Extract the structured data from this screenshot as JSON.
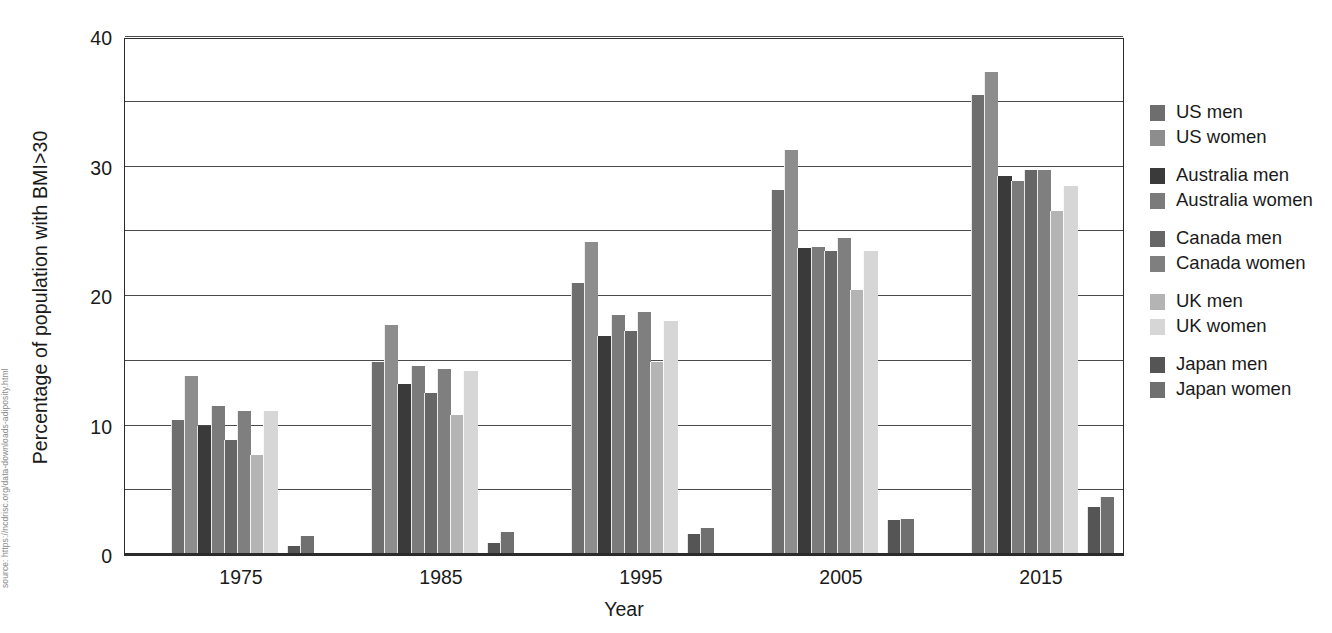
{
  "source_note": "source: https://ncdrisc.org/data-downloads-adiposity.html",
  "legend": {
    "groups": [
      {
        "items": [
          {
            "label": "US men",
            "color": "#6e6e6e"
          },
          {
            "label": "US women",
            "color": "#8d8d8d"
          }
        ]
      },
      {
        "items": [
          {
            "label": "Australia men",
            "color": "#3a3a3a"
          },
          {
            "label": "Australia women",
            "color": "#7b7b7b"
          }
        ]
      },
      {
        "items": [
          {
            "label": "Canada men",
            "color": "#666666"
          },
          {
            "label": "Canada women",
            "color": "#7f7f7f"
          }
        ]
      },
      {
        "items": [
          {
            "label": "UK men",
            "color": "#b4b4b4"
          },
          {
            "label": "UK women",
            "color": "#d6d6d6"
          }
        ]
      },
      {
        "items": [
          {
            "label": "Japan men",
            "color": "#555555"
          },
          {
            "label": "Japan women",
            "color": "#707070"
          }
        ]
      }
    ]
  },
  "chart_data": {
    "type": "bar",
    "title": "",
    "xlabel": "Year",
    "ylabel": "Percentage of population with BMI>30",
    "categories": [
      "1975",
      "1985",
      "1995",
      "2005",
      "2015"
    ],
    "ylim": [
      0,
      40
    ],
    "yticks": [
      0,
      10,
      20,
      30,
      40
    ],
    "ytick_labels": [
      "0",
      "10",
      "20",
      "30",
      "40"
    ],
    "gridlines": [
      0,
      5,
      10,
      15,
      20,
      25,
      30,
      35,
      40
    ],
    "grid": true,
    "legend_position": "right",
    "series": [
      {
        "name": "US men",
        "color": "#6e6e6e",
        "values": [
          10.4,
          14.9,
          21.0,
          28.2,
          35.5
        ]
      },
      {
        "name": "US women",
        "color": "#8d8d8d",
        "values": [
          13.8,
          17.8,
          24.2,
          31.3,
          37.3
        ]
      },
      {
        "name": "Australia men",
        "color": "#3a3a3a",
        "values": [
          10.0,
          13.2,
          16.9,
          23.7,
          29.3
        ]
      },
      {
        "name": "Australia women",
        "color": "#7b7b7b",
        "values": [
          11.5,
          14.6,
          18.5,
          23.8,
          28.9
        ]
      },
      {
        "name": "Canada men",
        "color": "#666666",
        "values": [
          8.9,
          12.5,
          17.3,
          23.5,
          29.7
        ]
      },
      {
        "name": "Canada women",
        "color": "#7f7f7f",
        "values": [
          11.1,
          14.4,
          18.8,
          24.5,
          29.7
        ]
      },
      {
        "name": "UK men",
        "color": "#b4b4b4",
        "values": [
          7.7,
          10.8,
          14.9,
          20.5,
          26.6
        ]
      },
      {
        "name": "UK women",
        "color": "#d6d6d6",
        "values": [
          11.1,
          14.2,
          18.1,
          23.5,
          28.5
        ]
      },
      {
        "name": "Japan men",
        "color": "#555555",
        "values": [
          0.7,
          0.9,
          1.6,
          2.7,
          3.7
        ]
      },
      {
        "name": "Japan women",
        "color": "#707070",
        "values": [
          1.5,
          1.8,
          2.1,
          2.8,
          4.5
        ]
      }
    ]
  }
}
